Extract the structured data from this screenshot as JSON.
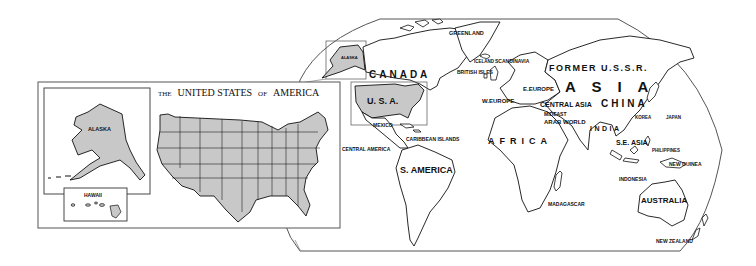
{
  "inset": {
    "title_prefix": "THE",
    "title_main": "UNITED STATES",
    "title_of": "OF",
    "title_end": "AMERICA",
    "alaska_label": "ALASKA",
    "hawaii_label": "HAWAII"
  },
  "world": {
    "labels": {
      "greenland": "GREENLAND",
      "iceland": "ICELAND",
      "scandinavia": "SCANDINAVIA",
      "british_isles": "BRITISH ISLES",
      "alaska": "ALASKA",
      "canada": "CANADA",
      "usa": "U. S. A.",
      "mexico": "MEXICO",
      "caribbean": "CARIBBEAN ISLANDS",
      "central_america": "CENTRAL AMERICA",
      "south_america": "S. AMERICA",
      "former_ussr": "FORMER U.S.S.R.",
      "asia": "A S I A",
      "e_europe": "E.EUROPE",
      "w_europe": "W.EUROPE",
      "central_asia": "CENTRAL ASIA",
      "china": "CHINA",
      "mideast": "MIDEAST",
      "arab_world": "ARAB WORLD",
      "india": "INDIA",
      "korea": "KOREA",
      "japan": "JAPAN",
      "se_asia": "S.E. ASIA",
      "philippines": "PHILIPPINES",
      "new_guinea": "NEW GUINEA",
      "indonesia": "INDONESIA",
      "africa": "AFRICA",
      "madagascar": "MADAGASCAR",
      "australia": "AUSTRALIA",
      "new_zealand": "NEW ZEALAND"
    }
  },
  "colors": {
    "highlight_fill": "#c8c8c8",
    "outline": "#111111",
    "frame": "#555555"
  }
}
